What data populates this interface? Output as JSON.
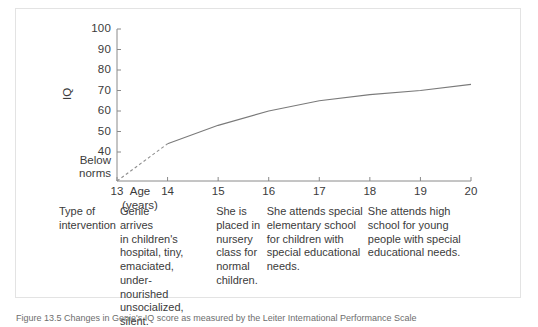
{
  "figure": {
    "caption": "Figure 13.5   Changes in Genie's IQ score as measured by the Leiter International Performance Scale",
    "border_color": "#e3e3e3"
  },
  "chart_data": {
    "type": "line",
    "title": "",
    "xlabel": "Age",
    "xlabel_unit": "(years)",
    "ylabel": "IQ",
    "xlim": [
      13,
      20
    ],
    "ylim": [
      30,
      100
    ],
    "grid": false,
    "legend": null,
    "yticks": [
      100,
      90,
      80,
      70,
      60,
      50,
      40
    ],
    "ybaseline_labels": [
      "Below",
      "norms"
    ],
    "xticks": [
      13,
      14,
      15,
      16,
      17,
      18,
      19,
      20
    ],
    "line_color": "#7a7a7a",
    "series": [
      {
        "name": "Genie IQ (estimated, dashed)",
        "style": "dashed",
        "x": [
          13,
          14
        ],
        "values": [
          31,
          44
        ]
      },
      {
        "name": "Genie IQ (measured, solid)",
        "style": "solid",
        "x": [
          14,
          15,
          16,
          17,
          18,
          19,
          20
        ],
        "values": [
          44,
          53,
          60,
          65,
          68,
          70,
          73
        ]
      }
    ]
  },
  "intervention_row": {
    "label_line1": "Type of",
    "label_line2": "intervention",
    "entries": [
      {
        "id": "age-13",
        "text": "Genie arrives\nin children's\nhospital, tiny,\nemaciated,\nunder-\nnourished\nunsocialized,\nsilent."
      },
      {
        "id": "age-15",
        "text": "She is\nplaced in\nnursery\nclass for\nnormal\nchildren."
      },
      {
        "id": "age-16",
        "text": "She attends special\nelementary school\nfor children with\nspecial educational\nneeds."
      },
      {
        "id": "age-18",
        "text": "She attends high\nschool for young\npeople with special\neducational needs."
      }
    ]
  }
}
